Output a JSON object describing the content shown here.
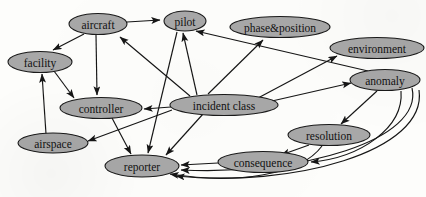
{
  "diagram": {
    "type": "directed-graph",
    "canvas": {
      "width": 426,
      "height": 197
    },
    "style": {
      "node_fill": "#a8a8a8",
      "node_stroke": "#1a1a1a",
      "edge_color": "#161616",
      "background": "#fdfdfb",
      "label_color": "#121212"
    },
    "nodes": [
      {
        "id": "aircraft",
        "label": "aircraft",
        "cx": 98,
        "cy": 24,
        "rx": 29,
        "ry": 10.5,
        "font": 11.5
      },
      {
        "id": "pilot",
        "label": "pilot",
        "cx": 185,
        "cy": 21,
        "rx": 21,
        "ry": 10,
        "font": 11.5
      },
      {
        "id": "phase_position",
        "label": "phase&position",
        "cx": 280,
        "cy": 27,
        "rx": 50,
        "ry": 10.5,
        "font": 11.5
      },
      {
        "id": "environment",
        "label": "environment",
        "cx": 377,
        "cy": 48,
        "rx": 47,
        "ry": 10.5,
        "font": 11.5
      },
      {
        "id": "facility",
        "label": "facility",
        "cx": 40,
        "cy": 62,
        "rx": 32,
        "ry": 10.5,
        "font": 11.5
      },
      {
        "id": "anomaly",
        "label": "anomaly",
        "cx": 385,
        "cy": 80,
        "rx": 35,
        "ry": 10.5,
        "font": 11.5
      },
      {
        "id": "controller",
        "label": "controller",
        "cx": 101,
        "cy": 108,
        "rx": 41,
        "ry": 10.5,
        "font": 11.5
      },
      {
        "id": "incident_class",
        "label": "incident class",
        "cx": 224,
        "cy": 105,
        "rx": 54,
        "ry": 10.5,
        "font": 11.5
      },
      {
        "id": "resolution",
        "label": "resolution",
        "cx": 329,
        "cy": 135,
        "rx": 41,
        "ry": 10.5,
        "font": 11.5
      },
      {
        "id": "airspace",
        "label": "airspace",
        "cx": 53,
        "cy": 143,
        "rx": 35,
        "ry": 10,
        "font": 11.5
      },
      {
        "id": "reporter",
        "label": "reporter",
        "cx": 142,
        "cy": 166,
        "rx": 37,
        "ry": 11,
        "font": 11.5
      },
      {
        "id": "consequence",
        "label": "consequence",
        "cx": 263,
        "cy": 162,
        "rx": 45,
        "ry": 10.5,
        "font": 11.5
      }
    ],
    "edges": [
      {
        "id": "e1",
        "from": "aircraft",
        "to": "pilot",
        "path": "M 127 22 L 160 20"
      },
      {
        "id": "e2",
        "from": "aircraft",
        "to": "facility",
        "path": "M 84 34 L 53 50"
      },
      {
        "id": "e3",
        "from": "aircraft",
        "to": "controller",
        "path": "M 96 35 L 97 95"
      },
      {
        "id": "e4",
        "from": "incident_class",
        "to": "aircraft",
        "path": "M 190 96 L 120 37"
      },
      {
        "id": "e5",
        "from": "incident_class",
        "to": "pilot",
        "path": "M 197 95 L 183 33"
      },
      {
        "id": "e6",
        "from": "incident_class",
        "to": "phase_position",
        "path": "M 208 94 L 263 40"
      },
      {
        "id": "e7",
        "from": "incident_class",
        "to": "environment",
        "path": "M 258 98 L 337 56"
      },
      {
        "id": "e8",
        "from": "incident_class",
        "to": "anomaly",
        "path": "M 272 101 L 351 83"
      },
      {
        "id": "e9",
        "from": "incident_class",
        "to": "controller",
        "path": "M 171 107 L 144 109"
      },
      {
        "id": "e10",
        "from": "incident_class",
        "to": "reporter",
        "path": "M 203 114 L 166 155"
      },
      {
        "id": "e11",
        "from": "incident_class",
        "to": "airspace",
        "path": "M 172 110 L 88 141"
      },
      {
        "id": "e12",
        "from": "facility",
        "to": "controller",
        "path": "M 54 71 L 74 98"
      },
      {
        "id": "e13",
        "from": "airspace",
        "to": "facility",
        "path": "M 46 134 L 42 74"
      },
      {
        "id": "e14",
        "from": "controller",
        "to": "reporter",
        "path": "M 112 118 L 131 154"
      },
      {
        "id": "e15",
        "from": "pilot",
        "to": "reporter",
        "path": "M 177 32 L 148 153"
      },
      {
        "id": "e16",
        "from": "anomaly",
        "to": "pilot",
        "path": "M 368 71 L 196 31"
      },
      {
        "id": "e17",
        "from": "anomaly",
        "to": "resolution",
        "path": "M 377 91 L 341 124"
      },
      {
        "id": "e18",
        "from": "anomaly",
        "to": "consequence",
        "path": "M 401 91 C 404 128, 360 158, 311 162"
      },
      {
        "id": "e19",
        "from": "anomaly",
        "to": "reporter",
        "path": "M 412 88 C 424 140, 300 176, 181 170"
      },
      {
        "id": "e20",
        "from": "anomaly",
        "to": "reporter",
        "path": "M 419 90 C 428 152, 290 188, 176 176"
      },
      {
        "id": "e21",
        "from": "resolution",
        "to": "consequence",
        "path": "M 309 145 L 281 155"
      },
      {
        "id": "e22",
        "from": "resolution",
        "to": "reporter",
        "path": "M 322 146 C 300 176, 235 184, 170 174"
      },
      {
        "id": "e23",
        "from": "consequence",
        "to": "reporter",
        "path": "M 218 163 L 181 165"
      }
    ]
  }
}
